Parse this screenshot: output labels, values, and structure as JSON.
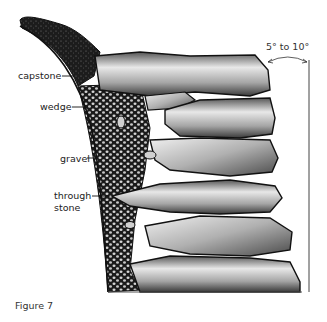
{
  "figure": {
    "caption": "Figure 7",
    "angle_label": "5° to 10°",
    "labels": [
      {
        "id": "capstone",
        "text": "capstone"
      },
      {
        "id": "wedge",
        "text": "wedge"
      },
      {
        "id": "gravel",
        "text": "gravel"
      },
      {
        "id": "through_stone_line1",
        "text": "through"
      },
      {
        "id": "through_stone_line2",
        "text": "stone"
      }
    ],
    "colors": {
      "ink": "#111111",
      "gravel_fill": "#1a1a1a",
      "gravel_stone": "#d8d8d8",
      "stone_light": "#e6e6e6",
      "stone_mid": "#9a9a9a",
      "stone_dark": "#3a3a3a",
      "background": "#ffffff"
    }
  }
}
